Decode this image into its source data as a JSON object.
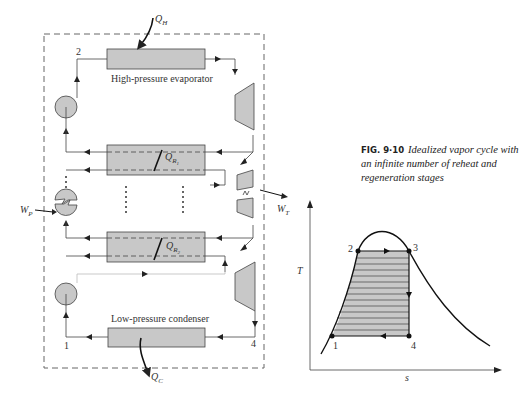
{
  "figure": {
    "number": "FIG. 9·10",
    "caption": "Idealized vapor cycle with an infinite number of reheat and regeneration stages"
  },
  "schematic": {
    "components": {
      "evaporator": "High-pressure evaporator",
      "condenser": "Low-pressure condenser"
    },
    "labels": {
      "qh": "Q",
      "qh_sub": "H",
      "qc": "Q",
      "qc_sub": "C",
      "qr1": "Q",
      "qr1_sub": "R",
      "qr1_subsub": "1",
      "qr2": "Q",
      "qr2_sub": "R",
      "qr2_subsub": "2",
      "wp": "W",
      "wp_sub": "P",
      "wt": "W",
      "wt_sub": "T"
    },
    "state_points": [
      "1",
      "2",
      "4"
    ]
  },
  "ts_diagram": {
    "y_axis": "T",
    "x_axis": "s",
    "points": [
      "1",
      "2",
      "3",
      "4"
    ]
  },
  "colors": {
    "fill": "#c8c8c8",
    "line": "#333333",
    "dashed": "#666666"
  }
}
